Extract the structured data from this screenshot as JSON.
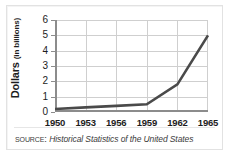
{
  "chart_data": {
    "type": "line",
    "title": "",
    "xlabel": "",
    "ylabel": "Dollars (in billions)",
    "ylabel_main": "Dollars",
    "ylabel_unit": "(in billions)",
    "categories": [
      "1950",
      "1953",
      "1956",
      "1959",
      "1962",
      "1965"
    ],
    "x": [
      1950,
      1953,
      1956,
      1959,
      1962,
      1965
    ],
    "values": [
      0.2,
      0.3,
      0.4,
      0.5,
      1.8,
      5.0
    ],
    "series": [
      {
        "name": "Dollars",
        "values": [
          0.2,
          0.3,
          0.4,
          0.5,
          1.8,
          5.0
        ],
        "color": "#4a4a4a"
      }
    ],
    "xlim": [
      1950,
      1965
    ],
    "ylim": [
      0,
      6
    ],
    "yticks": [
      0,
      1,
      2,
      3,
      4,
      5,
      6
    ],
    "ytick_labels": [
      "0",
      "1",
      "2",
      "3",
      "4",
      "5",
      "6"
    ],
    "xticks": [
      1950,
      1953,
      1956,
      1959,
      1962,
      1965
    ],
    "xtick_labels": [
      "1950",
      "1953",
      "1956",
      "1959",
      "1962",
      "1965"
    ],
    "grid": true,
    "grid_color": "#cfcfcf",
    "legend": false,
    "legend_position": "none",
    "axis_color": "#8c8c8c",
    "background": "#ffffff"
  },
  "source": {
    "keyword": "Source:",
    "title": "Historical Statistics of the United States"
  },
  "frame": {
    "border_color": "#e2e2e2"
  }
}
